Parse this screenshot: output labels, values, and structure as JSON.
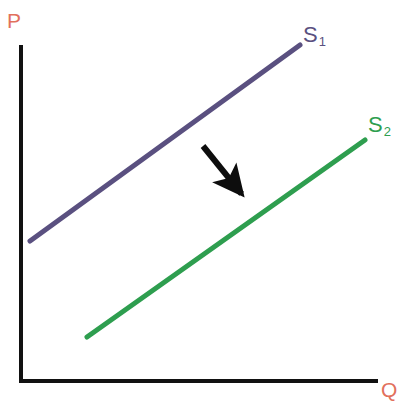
{
  "figure": {
    "kind": "economics-supply-shift-diagram",
    "background_color": "#ffffff",
    "width": 399,
    "height": 404
  },
  "axes": {
    "color": "#111111",
    "thickness": 4,
    "vertical": {
      "x": 20,
      "y_top": 45,
      "y_bottom": 382
    },
    "horizontal": {
      "y": 382,
      "x_left": 20,
      "x_right": 378
    },
    "y_label": "P",
    "x_label": "Q",
    "label_color": "#e2705c"
  },
  "curves": [
    {
      "id": "s1",
      "label": "S",
      "subscript": "1",
      "color": "#5a5080",
      "thickness": 5,
      "x1": 30,
      "y1": 241,
      "x2": 300,
      "y2": 45,
      "label_color": "#5a5080"
    },
    {
      "id": "s2",
      "label": "S",
      "subscript": "2",
      "color": "#2e9e4f",
      "thickness": 5,
      "x1": 87,
      "y1": 337,
      "x2": 365,
      "y2": 140,
      "label_color": "#2e9e4f"
    }
  ],
  "arrow": {
    "id": "shift-arrow",
    "color": "#0d0d0d",
    "thickness": 6,
    "tail_x": 203,
    "tail_y": 146,
    "tip_x": 249,
    "tip_y": 203,
    "head_length": 19,
    "head_width": 15
  },
  "chart_data": {
    "type": "line",
    "title": "",
    "xlabel": "Q",
    "ylabel": "P",
    "xlim": [
      0,
      100
    ],
    "ylim": [
      0,
      100
    ],
    "grid": false,
    "legend": "inline-end-labels",
    "annotations": [
      {
        "type": "arrow",
        "text": "",
        "from": [
          54,
          70
        ],
        "to": [
          66,
          53
        ],
        "color": "#0d0d0d",
        "meaning": "rightward/downward shift of supply from S1 to S2"
      }
    ],
    "series": [
      {
        "name": "S",
        "subscript": "1",
        "label": "S1",
        "color": "#5a5080",
        "x": [
          3,
          78
        ],
        "y": [
          42,
          100
        ],
        "slope": "upward"
      },
      {
        "name": "S",
        "subscript": "2",
        "label": "S2",
        "color": "#2e9e4f",
        "x": [
          19,
          96
        ],
        "y": [
          13,
          72
        ],
        "slope": "upward"
      }
    ]
  }
}
